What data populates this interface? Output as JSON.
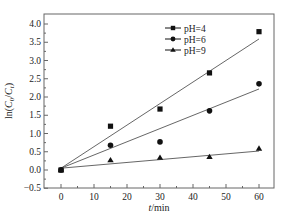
{
  "chart_data": {
    "type": "scatter",
    "title": "",
    "xlabel": "t/min",
    "ylabel": "ln(C0/Ct)",
    "xlim": [
      -5,
      65
    ],
    "ylim": [
      -0.5,
      4.25
    ],
    "x_ticks": [
      0,
      10,
      20,
      30,
      40,
      50,
      60
    ],
    "y_ticks": [
      -0.5,
      0.0,
      0.5,
      1.0,
      1.5,
      2.0,
      2.5,
      3.0,
      3.5,
      4.0
    ],
    "grid": false,
    "legend_position": "upper-center",
    "x": [
      0,
      15,
      30,
      45,
      60
    ],
    "series": [
      {
        "name": "pH=4",
        "marker": "square",
        "values": [
          0.0,
          1.2,
          1.67,
          2.66,
          3.79
        ],
        "fit_line": {
          "x": [
            0,
            60
          ],
          "y": [
            0.05,
            3.59
          ]
        }
      },
      {
        "name": "pH=6",
        "marker": "circle",
        "values": [
          0.0,
          0.68,
          0.77,
          1.62,
          2.36
        ],
        "fit_line": {
          "x": [
            0,
            60
          ],
          "y": [
            0.05,
            2.22
          ]
        }
      },
      {
        "name": "pH=9",
        "marker": "triangle",
        "values": [
          0.0,
          0.27,
          0.34,
          0.36,
          0.59
        ],
        "fit_line": {
          "x": [
            0,
            60
          ],
          "y": [
            0.05,
            0.52
          ]
        }
      }
    ]
  },
  "axes": {
    "xlabel_italic": "t",
    "xlabel_rest": "/min",
    "ylabel_prefix": "ln(",
    "ylabel_c": "C",
    "ylabel_sub0": "0",
    "ylabel_slash": "/",
    "ylabel_sub_t": "t",
    "ylabel_suffix": ")"
  },
  "legend": [
    {
      "label": "pH=4"
    },
    {
      "label": "pH=6"
    },
    {
      "label": "pH=9"
    }
  ]
}
